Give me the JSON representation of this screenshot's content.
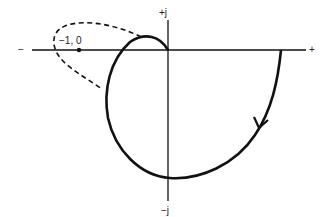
{
  "diagram": {
    "type": "nyquist-plot",
    "axes": {
      "real_negative_label": "−",
      "real_positive_label": "+",
      "imag_positive_label": "+j",
      "imag_negative_label": "−j"
    },
    "critical_point": {
      "label": "−1, 0"
    },
    "curves": [
      {
        "name": "solid-nyquist-contour",
        "style": "solid",
        "direction_arrow": "downward-clockwise"
      },
      {
        "name": "dashed-mirror-contour",
        "style": "dashed",
        "encircles_critical_point": true
      }
    ],
    "colors": {
      "line": "#111111",
      "background": "#ffffff"
    }
  }
}
